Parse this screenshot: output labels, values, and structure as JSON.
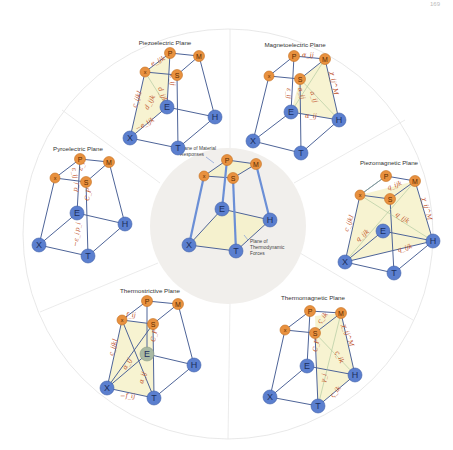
{
  "header": {
    "left_text": "",
    "page_number": "169"
  },
  "center": {
    "label_material": "Plane of Material",
    "label_material_2": "Responses",
    "label_forces": "Plane of",
    "label_forces_2": "Thermodynamic",
    "label_forces_3": "Forces"
  },
  "nodes": {
    "P": "P",
    "M": "M",
    "x": "x",
    "S": "S",
    "E": "E",
    "H": "H",
    "X": "X",
    "T": "T"
  },
  "sectors": [
    {
      "title": "Piezoelectric Plane",
      "coefficients": [
        "e_ijk",
        "c_ijkl",
        "d_ijk",
        "d_ijk",
        "ε_ij",
        "−e_ijk"
      ]
    },
    {
      "title": "Magnetoelectric Plane",
      "coefficients": [
        "α_ij",
        "ε_ij",
        "α_ij",
        "α_ij",
        "χ_ij^M",
        "α_ij"
      ]
    },
    {
      "title": "Piezomagnetic Plane",
      "coefficients": [
        "q_ijk",
        "c_ijkl",
        "q_ijk",
        "q_ijk",
        "χ_ij^M",
        "q_ijk"
      ]
    },
    {
      "title": "Thermomagnetic Plane",
      "coefficients": [
        "ς_ik",
        "C_P",
        "χ_ij^M",
        "ς_ik",
        "γ_i",
        "ς_ik"
      ]
    },
    {
      "title": "Thermostrictive Plane",
      "coefficients": [
        "f_ij",
        "c_ijkl",
        "α_ij",
        "C_P",
        "α_ij",
        "−f_ij"
      ]
    },
    {
      "title": "Pyroelectric Plane",
      "coefficients": [
        "ε_ij",
        "ε_i",
        "p_i",
        "C_P",
        "p_i",
        "−ε_i"
      ]
    }
  ],
  "colors": {
    "response_node": "#e8913f",
    "force_node": "#5b7fcf",
    "plane_fill": "#f6f1c9",
    "coefficient_text": "#c0522a",
    "center_disc": "#f1efec"
  }
}
